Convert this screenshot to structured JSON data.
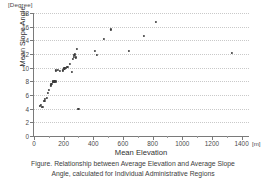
{
  "figure": {
    "y_unit_label": "[Degree]",
    "x_unit_label": "[m]",
    "caption_line_1": "Figure. Relationship between Average Elevation and Average Slope",
    "caption_line_2": "Angle, calculated for Individual Administrative Regions"
  },
  "colors": {
    "point": "#3b3b3b",
    "axis": "#7a7a7a",
    "grid": "#c9c9c9",
    "text": "#3d3d3d",
    "background": "#ffffff"
  },
  "chart_data": {
    "type": "scatter",
    "title": "Figure. Relationship between Average Elevation and Average Slope Angle, calculated for Individual Administrative Regions",
    "xlabel": "Mean Elevation",
    "ylabel": "Mean Slope Angle",
    "x_unit": "[m]",
    "y_unit": "[Degree]",
    "xlim": [
      0,
      1450
    ],
    "ylim": [
      0,
      18
    ],
    "xticks": [
      0,
      200,
      400,
      600,
      800,
      1000,
      1200,
      1400
    ],
    "xtick_labels": [
      "0",
      "200",
      "400",
      "600",
      "800",
      "1000",
      "1200",
      "1400"
    ],
    "yticks": [
      0,
      2,
      4,
      6,
      8,
      10,
      12,
      14,
      16,
      18
    ],
    "ytick_labels": [
      "0",
      "2",
      "4",
      "6",
      "8",
      "10",
      "12",
      "14",
      "16",
      "18"
    ],
    "grid": "horizontal-dotted",
    "legend": "none",
    "marker": "filled-circle",
    "points": [
      {
        "x": 40,
        "y": 4.4
      },
      {
        "x": 45,
        "y": 4.6
      },
      {
        "x": 55,
        "y": 4.2
      },
      {
        "x": 62,
        "y": 4.3
      },
      {
        "x": 70,
        "y": 5.1
      },
      {
        "x": 75,
        "y": 5.4
      },
      {
        "x": 88,
        "y": 5.6
      },
      {
        "x": 95,
        "y": 6.3
      },
      {
        "x": 100,
        "y": 6.7
      },
      {
        "x": 112,
        "y": 7.4
      },
      {
        "x": 118,
        "y": 7.6
      },
      {
        "x": 125,
        "y": 7.9
      },
      {
        "x": 130,
        "y": 8.0
      },
      {
        "x": 138,
        "y": 8.0
      },
      {
        "x": 150,
        "y": 8.0
      },
      {
        "x": 150,
        "y": 9.6
      },
      {
        "x": 160,
        "y": 9.7
      },
      {
        "x": 175,
        "y": 9.5
      },
      {
        "x": 195,
        "y": 9.6
      },
      {
        "x": 205,
        "y": 9.9
      },
      {
        "x": 215,
        "y": 10.0
      },
      {
        "x": 225,
        "y": 10.1
      },
      {
        "x": 240,
        "y": 10.6
      },
      {
        "x": 255,
        "y": 9.4
      },
      {
        "x": 262,
        "y": 11.3
      },
      {
        "x": 268,
        "y": 11.6
      },
      {
        "x": 272,
        "y": 11.9
      },
      {
        "x": 278,
        "y": 12.0
      },
      {
        "x": 285,
        "y": 11.5
      },
      {
        "x": 292,
        "y": 12.7
      },
      {
        "x": 300,
        "y": 4.0
      },
      {
        "x": 410,
        "y": 12.4
      },
      {
        "x": 425,
        "y": 11.85
      },
      {
        "x": 470,
        "y": 14.25
      },
      {
        "x": 520,
        "y": 15.6
      },
      {
        "x": 640,
        "y": 12.5
      },
      {
        "x": 740,
        "y": 14.7
      },
      {
        "x": 820,
        "y": 16.75
      },
      {
        "x": 1335,
        "y": 12.2
      }
    ]
  }
}
